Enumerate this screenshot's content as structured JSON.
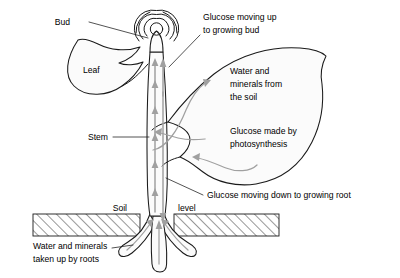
{
  "diagram": {
    "background_color": "#ffffff",
    "ink_color": "#1a1a1a",
    "flow_arrow_color": "#a0a0a0",
    "organ_fill_color": "#fbfbfb"
  },
  "labels": {
    "bud": "Bud",
    "leaf": "Leaf",
    "stem": "Stem",
    "soil": "Soil",
    "level": "level",
    "glucose_up_line1": "Glucose moving up",
    "glucose_up_line2": "to growing bud",
    "water_minerals_line1": "Water and",
    "water_minerals_line2": "minerals from",
    "water_minerals_line3": "the soil",
    "glucose_made_line1": "Glucose made by",
    "glucose_made_line2": "photosynthesis",
    "glucose_down": "Glucose moving down to growing root",
    "roots_line1": "Water and minerals",
    "roots_line2": "taken up by roots"
  },
  "structures": [
    {
      "name": "bud",
      "description": "coiled apical bud of concentric arcs at stem tip"
    },
    {
      "name": "left-leaf",
      "description": "leaf blade on the left joined to stem by a stalk"
    },
    {
      "name": "right-leaf",
      "description": "large leaf blade on the right joined to stem by a stalk"
    },
    {
      "name": "stem",
      "description": "vertical stem containing xylem and phloem channels"
    },
    {
      "name": "roots",
      "description": "three root branches below the soil line"
    },
    {
      "name": "soil",
      "description": "hatched ground layer marking the soil level"
    }
  ],
  "flows": [
    {
      "name": "xylem-up",
      "direction": "up",
      "carries": "water and minerals",
      "channel": "left"
    },
    {
      "name": "phloem-down",
      "direction": "down",
      "carries": "glucose",
      "channel": "right"
    },
    {
      "name": "glucose-to-bud",
      "direction": "up",
      "carries": "glucose",
      "channel": "right"
    },
    {
      "name": "water-into-leaf",
      "direction": "right",
      "carries": "water and minerals"
    },
    {
      "name": "glucose-out-of-leaf",
      "direction": "left",
      "carries": "glucose"
    },
    {
      "name": "root-uptake",
      "direction": "up",
      "carries": "water and minerals"
    }
  ]
}
